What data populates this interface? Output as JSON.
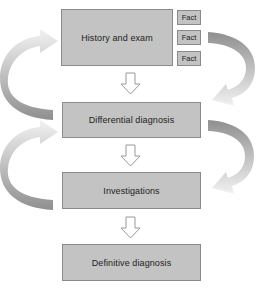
{
  "diagram": {
    "type": "flowchart",
    "steps": [
      {
        "id": "history",
        "label": "History and exam"
      },
      {
        "id": "differential",
        "label": "Differential diagnosis"
      },
      {
        "id": "investigations",
        "label": "Investigations"
      },
      {
        "id": "definitive",
        "label": "Definitive diagnosis"
      }
    ],
    "facts": [
      {
        "label": "Fact"
      },
      {
        "label": "Fact"
      },
      {
        "label": "Fact"
      }
    ],
    "connectors": [
      {
        "from": "history",
        "to": "differential",
        "style": "down-arrow"
      },
      {
        "from": "differential",
        "to": "investigations",
        "style": "down-arrow"
      },
      {
        "from": "investigations",
        "to": "definitive",
        "style": "down-arrow"
      }
    ],
    "feedback_loops": [
      {
        "side": "left",
        "from": "differential",
        "to": "history"
      },
      {
        "side": "right",
        "from": "history",
        "to": "differential"
      },
      {
        "side": "left",
        "from": "investigations",
        "to": "differential"
      },
      {
        "side": "right",
        "from": "differential",
        "to": "investigations"
      }
    ],
    "colors": {
      "box_fill": "#c3c3c3",
      "box_border": "#8a8a8a",
      "text": "#222222",
      "loop_dark": "#8f8f8f",
      "loop_light": "#f0f0f0"
    }
  }
}
